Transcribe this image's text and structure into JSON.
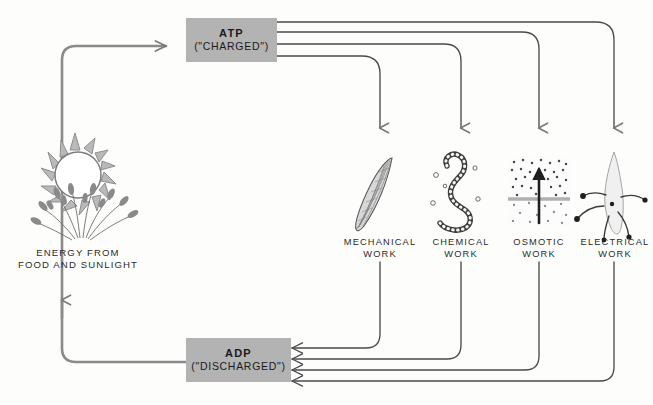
{
  "diagram": {
    "background_color": "#fdfdfc",
    "box_fill_color": "#b3b3b3",
    "arrow_color": "#6e6e6e",
    "line_color": "#4a4a4a"
  },
  "nodes": {
    "atp": {
      "label": "ATP",
      "state": "(\"CHARGED\")"
    },
    "adp": {
      "label": "ADP",
      "state": "(\"DISCHARGED\")"
    }
  },
  "energy_source": {
    "caption": "ENERGY FROM\nFOOD AND SUNLIGHT",
    "icons": [
      "sun-icon",
      "wheat-icon"
    ]
  },
  "work_outputs": [
    {
      "caption": "MECHANICAL\nWORK",
      "icon": "muscle-fiber-icon"
    },
    {
      "caption": "CHEMICAL\nWORK",
      "icon": "polymer-chain-icon"
    },
    {
      "caption": "OSMOTIC\nWORK",
      "icon": "membrane-transport-icon"
    },
    {
      "caption": "ELECTRICAL\nWORK",
      "icon": "neuron-icon"
    }
  ]
}
